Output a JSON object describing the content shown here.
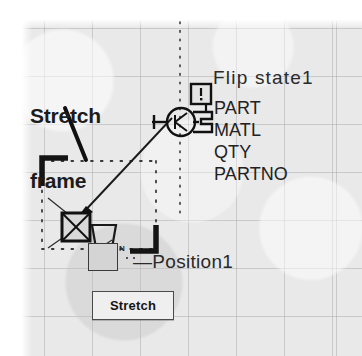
{
  "diagram": {
    "title_labels": {
      "stretch_frame_line1": "Stretch",
      "stretch_frame_line2": "frame",
      "flip_state": "Flip state1",
      "position": "—Position1"
    },
    "attributes": [
      {
        "name": "PART"
      },
      {
        "name": "MATL"
      },
      {
        "name": "QTY"
      },
      {
        "name": "PARTNO"
      }
    ],
    "button": {
      "stretch_label": "Stretch"
    },
    "icons": {
      "alert_badge": "!",
      "position_tool_superscript": "N"
    },
    "colors": {
      "canvas": "#e9e9e9",
      "grid_line": "#969696",
      "ink": "#1c1c1c",
      "button_face": "#efefef",
      "tool_face": "#d4d4d4"
    }
  }
}
